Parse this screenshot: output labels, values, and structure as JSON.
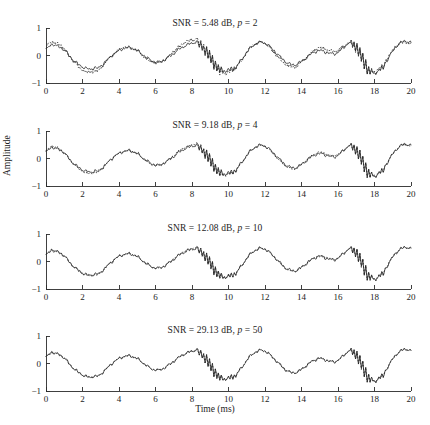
{
  "chart_data": {
    "type": "line",
    "title": "",
    "xlabel": "Time (ms)",
    "ylabel": "Amplitude",
    "xlim": [
      0,
      20
    ],
    "ylim": [
      -1,
      1
    ],
    "xticks": [
      0,
      2,
      4,
      6,
      8,
      10,
      12,
      14,
      16,
      18,
      20
    ],
    "yticks": [
      -1,
      0,
      1
    ],
    "grid": false,
    "legend": "none",
    "series_styles": [
      {
        "name": "reconstructed",
        "style": "solid",
        "color": "#262626"
      },
      {
        "name": "original",
        "style": "dotted",
        "color": "#3a3a3a"
      }
    ],
    "panels": [
      {
        "id": "panel-1",
        "title_prefix": "SNR = ",
        "snr": "5.48",
        "snr_unit": " dB, ",
        "p_symbol": "p",
        "p_eq": " = ",
        "p_value": "2",
        "title": "SNR = 5.48 dB, p = 2",
        "show_dotted": true,
        "deviation": 0.115
      },
      {
        "id": "panel-2",
        "title_prefix": "SNR = ",
        "snr": "9.18",
        "snr_unit": " dB, ",
        "p_symbol": "p",
        "p_eq": " = ",
        "p_value": "4",
        "title": "SNR = 9.18 dB, p = 4",
        "show_dotted": true,
        "deviation": 0.055
      },
      {
        "id": "panel-3",
        "title_prefix": "SNR = ",
        "snr": "12.08",
        "snr_unit": " dB, ",
        "p_symbol": "p",
        "p_eq": " = ",
        "p_value": "10",
        "title": "SNR = 12.08 dB, p = 10",
        "show_dotted": true,
        "deviation": 0.03
      },
      {
        "id": "panel-4",
        "title_prefix": "SNR = ",
        "snr": "29.13",
        "snr_unit": " dB, ",
        "p_symbol": "p",
        "p_eq": " = ",
        "p_value": "50",
        "title": "SNR = 29.13 dB, p = 50",
        "show_dotted": true,
        "deviation": 0.008
      }
    ],
    "x": [
      0.0,
      0.08,
      0.16,
      0.24,
      0.32,
      0.4,
      0.48,
      0.56,
      0.64,
      0.72,
      0.8,
      0.88,
      0.96,
      1.04,
      1.12,
      1.2,
      1.28,
      1.36,
      1.44,
      1.52,
      1.6,
      1.68,
      1.76,
      1.84,
      1.92,
      2.0,
      2.08,
      2.16,
      2.24,
      2.32,
      2.4,
      2.48,
      2.56,
      2.64,
      2.72,
      2.8,
      2.88,
      2.96,
      3.04,
      3.12,
      3.2,
      3.28,
      3.36,
      3.44,
      3.52,
      3.6,
      3.68,
      3.76,
      3.84,
      3.92,
      4.0,
      4.08,
      4.16,
      4.24,
      4.32,
      4.4,
      4.48,
      4.56,
      4.64,
      4.72,
      4.8,
      4.88,
      4.96,
      5.04,
      5.12,
      5.2,
      5.28,
      5.36,
      5.44,
      5.52,
      5.6,
      5.68,
      5.76,
      5.84,
      5.92,
      6.0,
      6.08,
      6.16,
      6.24,
      6.32,
      6.4,
      6.48,
      6.56,
      6.64,
      6.72,
      6.8,
      6.88,
      6.96,
      7.04,
      7.12,
      7.2,
      7.28,
      7.36,
      7.44,
      7.52,
      7.6,
      7.68,
      7.76,
      7.84,
      7.92,
      8.0,
      8.08,
      8.16,
      8.24,
      8.32,
      8.4,
      8.48,
      8.56,
      8.64,
      8.72,
      8.8,
      8.88,
      8.96,
      9.04,
      9.12,
      9.2,
      9.28,
      9.36,
      9.44,
      9.52,
      9.6,
      9.68,
      9.76,
      9.84,
      9.92,
      10.0,
      10.08,
      10.16,
      10.24,
      10.32,
      10.4,
      10.48,
      10.56,
      10.64,
      10.72,
      10.8,
      10.88,
      10.96,
      11.04,
      11.12,
      11.2,
      11.28,
      11.36,
      11.44,
      11.52,
      11.6,
      11.68,
      11.76,
      11.84,
      11.92,
      12.0,
      12.08,
      12.16,
      12.24,
      12.32,
      12.4,
      12.48,
      12.56,
      12.64,
      12.72,
      12.8,
      12.88,
      12.96,
      13.04,
      13.12,
      13.2,
      13.28,
      13.36,
      13.44,
      13.52,
      13.6,
      13.68,
      13.76,
      13.84,
      13.92,
      14.0,
      14.08,
      14.16,
      14.24,
      14.32,
      14.4,
      14.48,
      14.56,
      14.64,
      14.72,
      14.8,
      14.88,
      14.96,
      15.04,
      15.12,
      15.2,
      15.28,
      15.36,
      15.44,
      15.52,
      15.6,
      15.68,
      15.76,
      15.84,
      15.92,
      16.0,
      16.08,
      16.16,
      16.24,
      16.32,
      16.4,
      16.48,
      16.56,
      16.64,
      16.72,
      16.8,
      16.88,
      16.96,
      17.04,
      17.12,
      17.2,
      17.28,
      17.36,
      17.44,
      17.52,
      17.6,
      17.68,
      17.76,
      17.84,
      17.92,
      18.0,
      18.08,
      18.16,
      18.24,
      18.32,
      18.4,
      18.48,
      18.56,
      18.64,
      18.72,
      18.8,
      18.88,
      18.96,
      19.04,
      19.12,
      19.2,
      19.28,
      19.36,
      19.44,
      19.52,
      19.6,
      19.68,
      19.76,
      19.84,
      19.92,
      20.0
    ],
    "y": [
      0.22,
      0.27,
      0.33,
      0.39,
      0.42,
      0.4,
      0.36,
      0.34,
      0.35,
      0.33,
      0.3,
      0.26,
      0.22,
      0.17,
      0.11,
      0.05,
      -0.02,
      -0.08,
      -0.13,
      -0.18,
      -0.23,
      -0.27,
      -0.31,
      -0.35,
      -0.38,
      -0.41,
      -0.44,
      -0.46,
      -0.48,
      -0.49,
      -0.5,
      -0.49,
      -0.47,
      -0.45,
      -0.46,
      -0.47,
      -0.45,
      -0.41,
      -0.36,
      -0.31,
      -0.26,
      -0.21,
      -0.16,
      -0.11,
      -0.06,
      -0.01,
      0.04,
      0.08,
      0.12,
      0.15,
      0.18,
      0.21,
      0.23,
      0.25,
      0.26,
      0.27,
      0.28,
      0.28,
      0.27,
      0.26,
      0.24,
      0.22,
      0.19,
      0.16,
      0.12,
      0.08,
      0.04,
      0.0,
      -0.04,
      -0.08,
      -0.12,
      -0.15,
      -0.18,
      -0.2,
      -0.22,
      -0.23,
      -0.24,
      -0.24,
      -0.23,
      -0.21,
      -0.19,
      -0.16,
      -0.13,
      -0.1,
      -0.06,
      -0.02,
      0.02,
      0.06,
      0.1,
      0.14,
      0.18,
      0.22,
      0.26,
      0.29,
      0.32,
      0.35,
      0.37,
      0.39,
      0.41,
      0.43,
      0.44,
      0.46,
      0.48,
      0.5,
      0.48,
      0.3,
      0.45,
      0.2,
      0.38,
      0.05,
      0.28,
      -0.1,
      0.15,
      -0.28,
      0.0,
      -0.42,
      -0.2,
      -0.55,
      -0.35,
      -0.62,
      -0.45,
      -0.58,
      -0.5,
      -0.62,
      -0.55,
      -0.48,
      -0.58,
      -0.45,
      -0.52,
      -0.4,
      -0.48,
      -0.35,
      -0.28,
      -0.22,
      -0.15,
      -0.08,
      0.0,
      0.08,
      0.15,
      0.21,
      0.27,
      0.32,
      0.36,
      0.4,
      0.43,
      0.45,
      0.47,
      0.48,
      0.48,
      0.47,
      0.45,
      0.42,
      0.38,
      0.34,
      0.29,
      0.24,
      0.19,
      0.13,
      0.08,
      0.02,
      -0.03,
      -0.08,
      -0.13,
      -0.18,
      -0.22,
      -0.26,
      -0.29,
      -0.31,
      -0.33,
      -0.34,
      -0.34,
      -0.33,
      -0.31,
      -0.28,
      -0.25,
      -0.21,
      -0.17,
      -0.13,
      -0.09,
      -0.05,
      -0.01,
      0.03,
      0.07,
      0.1,
      0.13,
      0.15,
      0.17,
      0.18,
      0.18,
      0.17,
      0.16,
      0.14,
      0.12,
      0.1,
      0.08,
      0.07,
      0.06,
      0.06,
      0.07,
      0.09,
      0.12,
      0.16,
      0.2,
      0.25,
      0.3,
      0.35,
      0.4,
      0.44,
      0.48,
      0.5,
      0.3,
      0.52,
      0.18,
      0.45,
      0.0,
      0.3,
      -0.25,
      0.1,
      -0.48,
      -0.12,
      -0.68,
      -0.35,
      -0.72,
      -0.52,
      -0.65,
      -0.6,
      -0.7,
      -0.55,
      -0.48,
      -0.58,
      -0.4,
      -0.5,
      -0.3,
      -0.22,
      -0.14,
      -0.05,
      0.04,
      0.12,
      0.2,
      0.27,
      0.33,
      0.38,
      0.42,
      0.46,
      0.49,
      0.51,
      0.52,
      0.52,
      0.51,
      0.49,
      0.46,
      0.42,
      0.38,
      0.33,
      0.28,
      0.23,
      0.18,
      0.13,
      0.08,
      0.03,
      -0.02,
      -0.06,
      -0.1,
      -0.14,
      -0.17,
      -0.2,
      -0.22,
      -0.23,
      -0.24,
      -0.24,
      -0.23,
      -0.21,
      -0.18,
      -0.14,
      -0.1,
      -0.05,
      0.0,
      0.05,
      0.1,
      0.15,
      0.19,
      0.23,
      0.26
    ]
  }
}
